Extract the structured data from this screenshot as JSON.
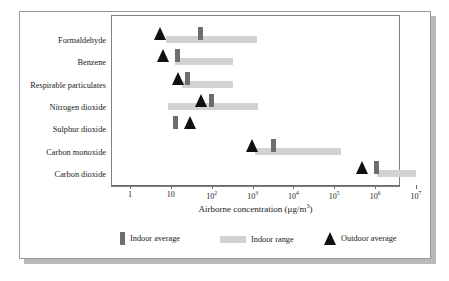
{
  "figure": {
    "background": "#ffffff",
    "frame_color": "#9a9a9a",
    "panel_border": "#808080"
  },
  "colors": {
    "indoor_average": "#6e6e6e",
    "indoor_range": "#d2d2d2",
    "outdoor_average": "#111111",
    "text": "#1a1a1a"
  },
  "legend": {
    "indoor_average_label": "Indoor average",
    "indoor_range_label": "Indoor range",
    "outdoor_average_label": "Outdoor average"
  },
  "axis": {
    "title_text": "Airborne concentration (μg/m",
    "title_sup": "3",
    "title_tail": ")",
    "tick_labels": [
      "1",
      "10",
      "10",
      "10",
      "10",
      "10",
      "10",
      "10"
    ],
    "tick_exponents": [
      "",
      "",
      "2",
      "3",
      "4",
      "5",
      "6",
      "7"
    ],
    "tick_values": [
      1,
      10,
      100,
      1000,
      10000,
      100000,
      1000000,
      10000000
    ]
  },
  "chart_data": {
    "type": "bar",
    "title": "",
    "subtitle": "",
    "xlabel": "Airborne concentration (µg/m3)",
    "ylabel": "",
    "xscale": "log",
    "xlim": [
      1,
      10000000
    ],
    "grid": false,
    "legend_position": "bottom",
    "legend_entries": [
      "Indoor average",
      "Indoor range",
      "Outdoor average"
    ],
    "categories": [
      "Formaldehyde",
      "Benzene",
      "Respirable particulates",
      "Nitrogen dioxide",
      "Sulphur dioxide",
      "Carbon monoxide",
      "Carbon dioxide"
    ],
    "series": [
      {
        "name": "Indoor range",
        "type": "range",
        "values": [
          [
            8.5,
            860
          ],
          [
            13,
            170
          ],
          [
            17,
            170
          ],
          [
            10,
            860
          ],
          [
            null,
            null
          ],
          [
            1200,
            150000
          ],
          [
            1300000,
            10000000
          ]
        ]
      },
      {
        "name": "Indoor average",
        "type": "marker",
        "values": [
          55,
          13,
          23,
          100,
          12,
          3200,
          1200000
        ]
      },
      {
        "name": "Outdoor average",
        "type": "marker",
        "values": [
          5.4,
          6.5,
          16,
          55,
          30,
          1000,
          480000
        ]
      }
    ]
  },
  "rows": [
    {
      "label": "Formaldehyde",
      "range_start_px": 166,
      "range_end_px": 257,
      "avg_px": 200,
      "outdoor_px": 160,
      "has_range": true
    },
    {
      "label": "Benzene",
      "range_start_px": 175,
      "range_end_px": 233,
      "avg_px": 177,
      "outdoor_px": 163,
      "has_range": true
    },
    {
      "label": "Respirable particulates",
      "range_start_px": 182,
      "range_end_px": 233,
      "avg_px": 187,
      "outdoor_px": 178,
      "has_range": true
    },
    {
      "label": "Nitrogen dioxide",
      "range_start_px": 168,
      "range_end_px": 258,
      "avg_px": 211,
      "outdoor_px": 201,
      "has_range": true
    },
    {
      "label": "Sulphur dioxide",
      "range_start_px": 0,
      "range_end_px": 0,
      "avg_px": 175,
      "outdoor_px": 190,
      "has_range": false
    },
    {
      "label": "Carbon monoxide",
      "range_start_px": 255,
      "range_end_px": 341,
      "avg_px": 273,
      "outdoor_px": 252,
      "has_range": true
    },
    {
      "label": "Carbon dioxide",
      "range_start_px": 377,
      "range_end_px": 416,
      "avg_px": 376,
      "outdoor_px": 362,
      "has_range": true
    }
  ]
}
